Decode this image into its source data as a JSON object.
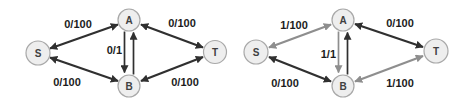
{
  "colors": {
    "background": "#ffffff",
    "edge_dark": "#303030",
    "edge_flow": "#8e8e8e",
    "node_fill": "#eeeeee",
    "node_border": "#a8a8a8",
    "node_text": "#404040",
    "label_text": "#1c1c1c"
  },
  "left_graph": {
    "nodes": [
      {
        "id": "S"
      },
      {
        "id": "A"
      },
      {
        "id": "B"
      },
      {
        "id": "T"
      }
    ],
    "edges": [
      {
        "from": "S",
        "to": "A",
        "label": "0/100",
        "arrows": "both",
        "color": "dark"
      },
      {
        "from": "A",
        "to": "T",
        "label": "0/100",
        "arrows": "both",
        "color": "dark"
      },
      {
        "from": "S",
        "to": "B",
        "label": "0/100",
        "arrows": "both",
        "color": "dark"
      },
      {
        "from": "B",
        "to": "T",
        "label": "0/100",
        "arrows": "both",
        "color": "dark"
      },
      {
        "from": "A",
        "to": "B",
        "label": "0/1",
        "arrows": "forward",
        "color": "dark"
      },
      {
        "from": "B",
        "to": "A",
        "arrows": "forward",
        "color": "dark"
      }
    ]
  },
  "right_graph": {
    "nodes": [
      {
        "id": "S"
      },
      {
        "id": "A"
      },
      {
        "id": "B"
      },
      {
        "id": "T"
      }
    ],
    "edges": [
      {
        "from": "S",
        "to": "A",
        "label": "1/100",
        "arrows": "both",
        "color": "gray"
      },
      {
        "from": "A",
        "to": "T",
        "label": "0/100",
        "arrows": "both",
        "color": "dark"
      },
      {
        "from": "S",
        "to": "B",
        "label": "0/100",
        "arrows": "both",
        "color": "dark"
      },
      {
        "from": "B",
        "to": "T",
        "label": "1/100",
        "arrows": "both",
        "color": "gray"
      },
      {
        "from": "A",
        "to": "B",
        "label": "1/1",
        "arrows": "forward",
        "color": "gray"
      },
      {
        "from": "B",
        "to": "A",
        "arrows": "forward",
        "color": "dark"
      }
    ]
  }
}
